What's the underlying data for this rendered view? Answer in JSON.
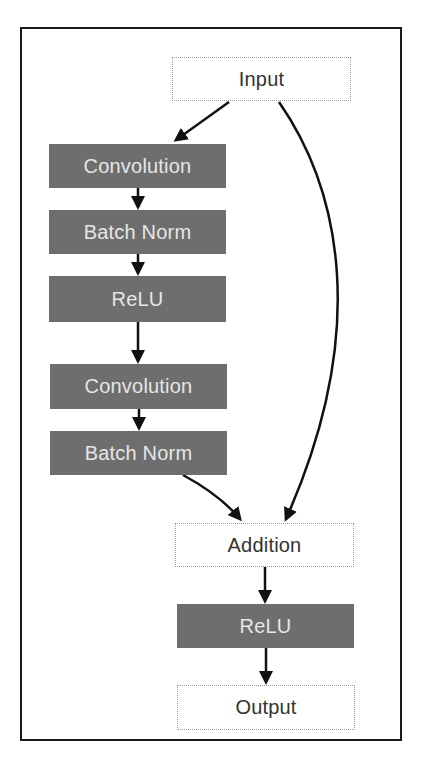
{
  "diagram": {
    "nodes": [
      {
        "id": "input",
        "label": "Input",
        "style": "light"
      },
      {
        "id": "conv1",
        "label": "Convolution",
        "style": "dark"
      },
      {
        "id": "bn1",
        "label": "Batch Norm",
        "style": "dark"
      },
      {
        "id": "relu1",
        "label": "ReLU",
        "style": "dark"
      },
      {
        "id": "conv2",
        "label": "Convolution",
        "style": "dark"
      },
      {
        "id": "bn2",
        "label": "Batch Norm",
        "style": "dark"
      },
      {
        "id": "add",
        "label": "Addition",
        "style": "light"
      },
      {
        "id": "relu2",
        "label": "ReLU",
        "style": "dark"
      },
      {
        "id": "output",
        "label": "Output",
        "style": "light"
      }
    ],
    "edges": [
      {
        "from": "input",
        "to": "conv1"
      },
      {
        "from": "conv1",
        "to": "bn1"
      },
      {
        "from": "bn1",
        "to": "relu1"
      },
      {
        "from": "relu1",
        "to": "conv2"
      },
      {
        "from": "conv2",
        "to": "bn2"
      },
      {
        "from": "bn2",
        "to": "add"
      },
      {
        "from": "input",
        "to": "add",
        "type": "skip-connection"
      },
      {
        "from": "add",
        "to": "relu2"
      },
      {
        "from": "relu2",
        "to": "output"
      }
    ],
    "colors": {
      "dark_node": "#6e6e6e",
      "dark_text": "#e6e6e6",
      "light_node": "#ffffff",
      "light_text": "#333333",
      "edge": "#111111"
    }
  }
}
